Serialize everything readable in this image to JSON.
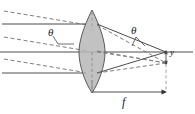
{
  "figure": {
    "kind": "optical-ray-diagram",
    "width_px": 195,
    "height_px": 114,
    "background_color": "#ffffff"
  },
  "labels": {
    "theta_left": "θ",
    "theta_right": "θ",
    "image_height": "y",
    "focal_length": "f"
  },
  "colors": {
    "lens_fill": "#b3b3b3",
    "lens_stroke": "#555555",
    "solid_ray": "#4d4d4d",
    "dashed_ray": "#6e6e6e",
    "axis": "#4d4d4d",
    "dimension": "#8c8c8c",
    "text": "#1a1a1a"
  },
  "geometry": {
    "lens": {
      "center_x": 92,
      "top_y": 10,
      "bottom_y": 93,
      "half_width": 13
    },
    "optical_axis_y": 52,
    "axis_x_start": 0,
    "axis_x_end": 193,
    "on_axis_focus": {
      "x": 166,
      "y": 52
    },
    "off_axis_focus": {
      "x": 166,
      "y": 63
    },
    "focal_dimension": {
      "x_start": 92,
      "x_end": 166,
      "y": 92
    }
  },
  "ray_bundles": [
    {
      "name": "axial-parallel-bundle",
      "style": "solid",
      "description": "Rays parallel to the optical axis entering the lens",
      "incoming_y": [
        24,
        52,
        73
      ],
      "converges_to": "on_axis_focus"
    },
    {
      "name": "oblique-parallel-bundle",
      "style": "dashed",
      "description": "Rays parallel to each other but inclined at angle theta to the axis",
      "incoming_start_y": [
        12,
        38,
        60
      ],
      "incoming_end_y": [
        24,
        50,
        72
      ],
      "converges_to": "off_axis_focus"
    }
  ],
  "annotations": [
    {
      "name": "angle-theta-object-space",
      "text": "θ",
      "near": "left of lens, between axis-parallel and oblique rays"
    },
    {
      "name": "angle-theta-image-space",
      "text": "θ",
      "near": "right of lens, at converging ray pair"
    },
    {
      "name": "image-height-y",
      "text": "y",
      "near": "focal plane, vertical offset from axis"
    },
    {
      "name": "focal-length-f",
      "text": "f",
      "near": "dimension arrow below lens"
    }
  ]
}
